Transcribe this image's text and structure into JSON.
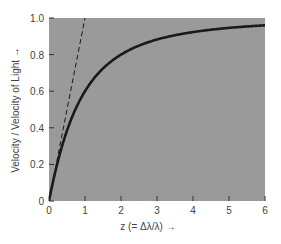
{
  "chart_data": {
    "type": "line",
    "title": "",
    "xlabel": "z (= Δλ/λ)",
    "ylabel": "Velocity / Velocity of Light",
    "xlim": [
      0,
      6
    ],
    "ylim": [
      0,
      1.0
    ],
    "x_ticks": [
      "0",
      "1",
      "2",
      "3",
      "4",
      "5",
      "6"
    ],
    "y_ticks": [
      "0",
      "0.2",
      "0.4",
      "0.6",
      "0.8",
      "1.0"
    ],
    "grid": false,
    "legend": null,
    "series": [
      {
        "name": "relativistic",
        "style": "solid",
        "x": [
          0,
          0.25,
          0.5,
          0.75,
          1,
          1.5,
          2,
          2.5,
          3,
          3.5,
          4,
          4.5,
          5,
          5.5,
          6
        ],
        "values": [
          0,
          0.22,
          0.38,
          0.51,
          0.6,
          0.72,
          0.8,
          0.85,
          0.88,
          0.91,
          0.92,
          0.94,
          0.95,
          0.95,
          0.96
        ]
      },
      {
        "name": "classical (v = cz)",
        "style": "dashed",
        "x": [
          0,
          1
        ],
        "values": [
          0,
          1.0
        ]
      }
    ],
    "plot_background": "#9a9a9a",
    "line_color": "#1a1a1a"
  },
  "labels": {
    "xlabel": "z (= Δλ/λ)",
    "ylabel": "Velocity / Velocity of Light"
  }
}
